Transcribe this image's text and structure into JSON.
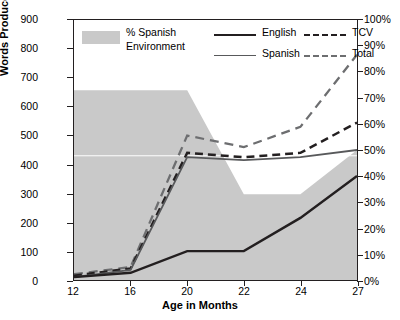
{
  "chart_data": {
    "type": "line",
    "title": "",
    "xlabel": "Age in Months",
    "ylabel": "Words Produced",
    "ylabel_right": "",
    "x": [
      12,
      16,
      20,
      22,
      24,
      27
    ],
    "xtick_labels": [
      "12",
      "16",
      "20",
      "22",
      "24",
      "27"
    ],
    "ylim": [
      0,
      900
    ],
    "ytick_labels": [
      "0",
      "100",
      "200",
      "300",
      "400",
      "500",
      "600",
      "700",
      "800",
      "900"
    ],
    "ylim_right": [
      0,
      100
    ],
    "ytick_labels_right": [
      "0%",
      "10%",
      "20%",
      "30%",
      "40%",
      "50%",
      "60%",
      "70%",
      "80%",
      "90%",
      "100%"
    ],
    "grid": false,
    "legend_position": "top-inside",
    "series": [
      {
        "name": "% Spanish Environment",
        "style": "area",
        "axis": "right",
        "color": "#c9c9c9",
        "values": [
          73,
          73,
          73,
          33,
          33,
          50
        ]
      },
      {
        "name": "English",
        "style": "solid",
        "axis": "left",
        "color": "#231f20",
        "values": [
          10,
          25,
          100,
          100,
          215,
          360
        ]
      },
      {
        "name": "Spanish",
        "style": "solid",
        "axis": "left",
        "color": "#58595b",
        "values": [
          10,
          35,
          425,
          415,
          425,
          450
        ]
      },
      {
        "name": "TCV",
        "style": "dashed",
        "axis": "left",
        "color": "#231f20",
        "values": [
          15,
          40,
          440,
          425,
          440,
          545
        ]
      },
      {
        "name": "Total",
        "style": "dashed",
        "axis": "left",
        "color": "#6d6e70",
        "values": [
          20,
          45,
          500,
          460,
          530,
          780
        ]
      }
    ]
  },
  "legend": {
    "area_label_line1": "% Spanish",
    "area_label_line2": "Environment",
    "english": "English",
    "spanish": "Spanish",
    "tcv": "TCV",
    "total": "Total"
  },
  "colors": {
    "area": "#c9c9c9",
    "english": "#231f20",
    "spanish": "#58595b",
    "tcv": "#231f20",
    "total": "#6d6e70",
    "axis": "#231f20",
    "gridline": "#ffffff"
  }
}
